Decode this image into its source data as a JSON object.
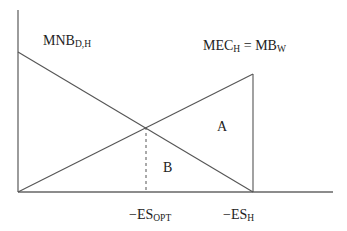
{
  "diagram": {
    "labels": {
      "mnb": {
        "main": "MNB",
        "sub": "D,H"
      },
      "mec": {
        "main1": "MEC",
        "sub1": "H",
        "eq": " = ",
        "main2": "MB",
        "sub2": "W"
      },
      "area_a": "A",
      "area_b": "B",
      "es_opt": {
        "main": "−ES",
        "sub": "OPT"
      },
      "es_h": {
        "main": "−ES",
        "sub": "H"
      }
    },
    "colors": {
      "line": "#555555",
      "axis": "#666666",
      "background": "#ffffff"
    }
  }
}
